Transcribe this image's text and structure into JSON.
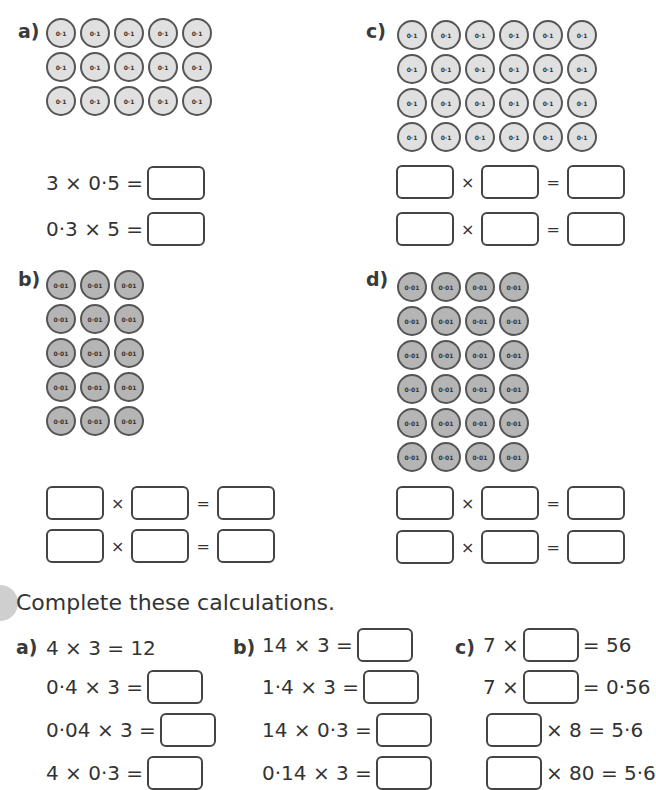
{
  "section1": {
    "a": {
      "label": "a)",
      "counter_value": "0·1",
      "rows": 3,
      "cols": 5,
      "equations": [
        {
          "text": "3 × 0·5 ="
        },
        {
          "text": "0·3 × 5 ="
        }
      ]
    },
    "b": {
      "label": "b)",
      "counter_value": "0·01",
      "rows": 5,
      "cols": 3
    },
    "c": {
      "label": "c)",
      "counter_value": "0·1",
      "rows": 4,
      "cols": 6
    },
    "d": {
      "label": "d)",
      "counter_value": "0·01",
      "rows": 6,
      "cols": 4
    },
    "times_symbol": "×",
    "equals_symbol": "="
  },
  "section2": {
    "heading": "Complete these calculations.",
    "a": {
      "label": "a)",
      "lines": [
        {
          "left": "4 × 3 = 12",
          "has_box": false
        },
        {
          "left": "0·4 × 3 =",
          "has_box": true
        },
        {
          "left": "0·04 × 3 =",
          "has_box": true
        },
        {
          "left": "4 × 0·3 =",
          "has_box": true
        }
      ]
    },
    "b": {
      "label": "b)",
      "lines": [
        {
          "left": "14 × 3 ="
        },
        {
          "left": "1·4 × 3 ="
        },
        {
          "left": "14 × 0·3 ="
        },
        {
          "left": "0·14 × 3 ="
        }
      ]
    },
    "c": {
      "label": "c)",
      "lines": [
        {
          "before": "7 ×",
          "after": "= 56"
        },
        {
          "before": "7 ×",
          "after": "= 0·56"
        },
        {
          "before": "",
          "after": "× 8 = 5·6"
        },
        {
          "before": "",
          "after": "× 80 = 5·6"
        }
      ]
    }
  }
}
